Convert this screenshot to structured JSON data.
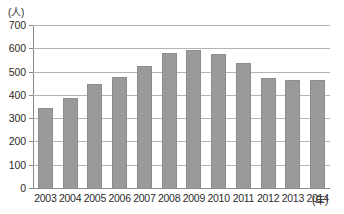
{
  "chart_data": {
    "type": "bar",
    "title": "",
    "subtitle": "",
    "xlabel": "(年)",
    "ylabel": "(人)",
    "categories": [
      "2003",
      "2004",
      "2005",
      "2006",
      "2007",
      "2008",
      "2009",
      "2010",
      "2011",
      "2012",
      "2013",
      "2014"
    ],
    "values": [
      343,
      387,
      447,
      478,
      523,
      580,
      592,
      575,
      537,
      472,
      463,
      466
    ],
    "series": [
      {
        "name": "人数",
        "values": [
          343,
          387,
          447,
          478,
          523,
          580,
          592,
          575,
          537,
          472,
          463,
          466
        ]
      }
    ],
    "ylim": [
      0,
      700
    ],
    "ytick_labels": [
      "700",
      "600",
      "500",
      "400",
      "300",
      "200",
      "100",
      "0"
    ],
    "ytick_values": [
      700,
      600,
      500,
      400,
      300,
      200,
      100,
      0
    ],
    "grid": true,
    "legend": false,
    "legend_position": "none",
    "bar_color": "#9a9a9a",
    "grid_color": "#b4b4b4",
    "axis_color": "#8a8a8a",
    "text_color": "#2b2b2b"
  },
  "axes": {
    "y_unit": "(人)",
    "x_unit": "(年)"
  }
}
